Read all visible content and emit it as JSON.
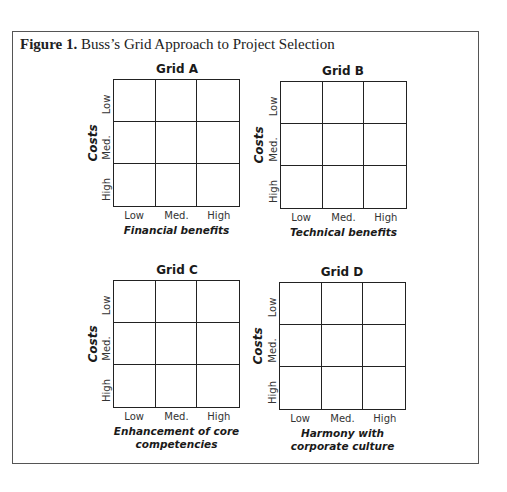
{
  "figure": {
    "label": "Figure 1.",
    "title": "Buss’s Grid Approach to Project Selection"
  },
  "axis": {
    "y_label": "Costs",
    "y_ticks": [
      "Low",
      "Med.",
      "High"
    ],
    "x_ticks": [
      "Low",
      "Med.",
      "High"
    ]
  },
  "grids": [
    {
      "title": "Grid A",
      "x_label_line1": "Financial benefits",
      "x_label_line2": ""
    },
    {
      "title": "Grid B",
      "x_label_line1": "Technical benefits",
      "x_label_line2": ""
    },
    {
      "title": "Grid C",
      "x_label_line1": "Enhancement of core",
      "x_label_line2": "competencies"
    },
    {
      "title": "Grid D",
      "x_label_line1": "Harmony with",
      "x_label_line2": "corporate culture"
    }
  ]
}
